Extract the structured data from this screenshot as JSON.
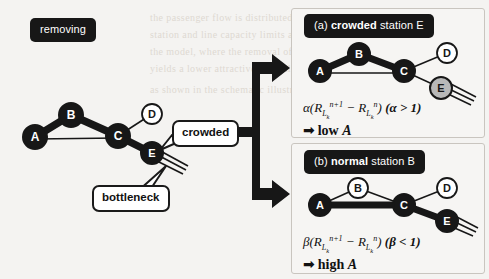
{
  "figure": {
    "width": 489,
    "height": 279,
    "background": "#f4f3f1",
    "ink": "#171717",
    "gray_node_fill": "#b8b8b8"
  },
  "main_label": {
    "text": "removing"
  },
  "callouts": {
    "crowded": "crowded",
    "bottleneck": "bottleneck"
  },
  "main_graph": {
    "nodes": [
      {
        "id": "A",
        "label": "A",
        "x": 35,
        "y": 137,
        "r": 12,
        "style": "filled"
      },
      {
        "id": "B",
        "label": "B",
        "x": 71,
        "y": 115,
        "r": 12,
        "style": "filled"
      },
      {
        "id": "C",
        "label": "C",
        "x": 118,
        "y": 136,
        "r": 12,
        "style": "filled"
      },
      {
        "id": "D",
        "label": "D",
        "x": 152,
        "y": 114,
        "r": 10,
        "style": "open"
      },
      {
        "id": "E",
        "label": "E",
        "x": 152,
        "y": 153,
        "r": 11,
        "style": "filled"
      }
    ],
    "edges": [
      {
        "from": "A",
        "to": "B",
        "weight": "thick"
      },
      {
        "from": "B",
        "to": "C",
        "weight": "thick"
      },
      {
        "from": "A",
        "to": "C",
        "weight": "thin"
      },
      {
        "from": "C",
        "to": "D",
        "weight": "thin"
      },
      {
        "from": "C",
        "to": "E",
        "weight": "thick"
      }
    ],
    "bottleneck_lines": 3
  },
  "panels": [
    {
      "id": "a",
      "header": {
        "prefix": "(a)",
        "bold": "crowded",
        "suffix": "station E"
      },
      "nodes": [
        {
          "id": "A",
          "label": "A",
          "x": 320,
          "y": 71,
          "r": 11,
          "style": "filled"
        },
        {
          "id": "B",
          "label": "B",
          "x": 359,
          "y": 54,
          "r": 11,
          "style": "filled"
        },
        {
          "id": "C",
          "label": "C",
          "x": 404,
          "y": 71,
          "r": 11,
          "style": "filled"
        },
        {
          "id": "D",
          "label": "D",
          "x": 447,
          "y": 53,
          "r": 10,
          "style": "open"
        },
        {
          "id": "E",
          "label": "E",
          "x": 441,
          "y": 88,
          "r": 11,
          "style": "gray"
        }
      ],
      "edges": [
        {
          "from": "A",
          "to": "B",
          "weight": "thick"
        },
        {
          "from": "B",
          "to": "C",
          "weight": "thick"
        },
        {
          "from": "A",
          "to": "C",
          "weight": "thin"
        },
        {
          "from": "C",
          "to": "D",
          "weight": "thin"
        },
        {
          "from": "C",
          "to": "E",
          "weight": "thin"
        }
      ],
      "bottleneck_lines": 3,
      "formula": {
        "coefficient": "α",
        "expression": "α(R_{L_k}^{n+1} − R_{L_k}^{n}) (α > 1)",
        "condition": "(α > 1)",
        "conclusion": "low A",
        "conclusion_prefix": "low",
        "conclusion_var": "A"
      }
    },
    {
      "id": "b",
      "header": {
        "prefix": "(b)",
        "bold": "normal",
        "suffix": "station B"
      },
      "nodes": [
        {
          "id": "A",
          "label": "A",
          "x": 320,
          "y": 205,
          "r": 11,
          "style": "filled"
        },
        {
          "id": "B",
          "label": "B",
          "x": 358,
          "y": 188,
          "r": 10,
          "style": "open"
        },
        {
          "id": "C",
          "label": "C",
          "x": 404,
          "y": 205,
          "r": 11,
          "style": "filled"
        },
        {
          "id": "D",
          "label": "D",
          "x": 447,
          "y": 188,
          "r": 10,
          "style": "open"
        },
        {
          "id": "E",
          "label": "E",
          "x": 447,
          "y": 221,
          "r": 11,
          "style": "filled"
        }
      ],
      "edges": [
        {
          "from": "A",
          "to": "B",
          "weight": "thin"
        },
        {
          "from": "B",
          "to": "C",
          "weight": "thin"
        },
        {
          "from": "A",
          "to": "C",
          "weight": "thick"
        },
        {
          "from": "C",
          "to": "D",
          "weight": "thin"
        },
        {
          "from": "C",
          "to": "E",
          "weight": "thick"
        }
      ],
      "bottleneck_lines": 3,
      "formula": {
        "coefficient": "β",
        "expression": "β(R_{L_k}^{n+1} − R_{L_k}^{n}) (β < 1)",
        "condition": "(β < 1)",
        "conclusion": "high A",
        "conclusion_prefix": "high",
        "conclusion_var": "A"
      }
    }
  ],
  "formula_parts": {
    "R": "R",
    "L": "L",
    "k": "k",
    "np1": "n+1",
    "n": "n",
    "minus": "−",
    "open_paren": "(",
    "close_paren": ")",
    "arrow": "➡"
  },
  "bleed_text": [
    "the passenger flow is distributed over the network",
    "station and line capacity limits are considered in",
    "the model, where the removal of a crowded station",
    "yields a lower attractiveness value than a normal one",
    "as shown in the schematic illustration below"
  ]
}
